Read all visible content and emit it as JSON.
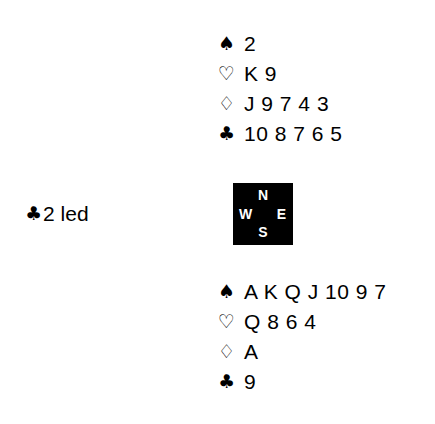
{
  "deal": {
    "background_color": "#ffffff",
    "text_color": "#000000",
    "north": {
      "label": "North hand",
      "suits": [
        {
          "suit": "spades",
          "symbol": "♠",
          "cards": "2"
        },
        {
          "suit": "hearts",
          "symbol": "♡",
          "cards": "K 9"
        },
        {
          "suit": "diamonds",
          "symbol": "♢",
          "cards": "J 9 7 4 3"
        },
        {
          "suit": "clubs",
          "symbol": "♣",
          "cards": "10 8 7 6 5"
        }
      ]
    },
    "south": {
      "label": "South hand",
      "suits": [
        {
          "suit": "spades",
          "symbol": "♠",
          "cards": "A K Q J 10 9 7"
        },
        {
          "suit": "hearts",
          "symbol": "♡",
          "cards": "Q 8 6 4"
        },
        {
          "suit": "diamonds",
          "symbol": "♢",
          "cards": "A"
        },
        {
          "suit": "clubs",
          "symbol": "♣",
          "cards": "9"
        }
      ]
    },
    "compass": {
      "north": "N",
      "west": "W",
      "east": "E",
      "south": "S",
      "box_color": "#000000",
      "letter_color": "#ffffff"
    },
    "lead": {
      "suit_symbol": "♣",
      "text": "2 led"
    }
  }
}
